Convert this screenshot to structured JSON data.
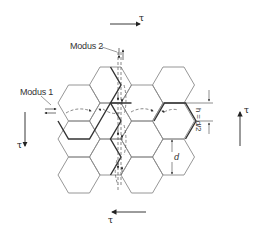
{
  "diagram": {
    "type": "honeycomb-shear-modes",
    "labels": {
      "mode1": "Modus 1",
      "mode2": "Modus 2",
      "dim_h": "h = d/2",
      "dim_d": "d",
      "tau_top": "τ",
      "tau_bottom": "τ",
      "tau_left": "τ",
      "tau_right": "τ"
    },
    "colors": {
      "stroke": "#8a8a8a",
      "bold": "#333333",
      "dash": "#555555"
    }
  }
}
